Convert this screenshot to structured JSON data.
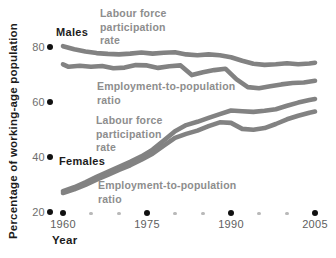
{
  "figure": {
    "y_axis": {
      "title": "Percentage of working-age population",
      "ticks": [
        {
          "value": 80,
          "label": "80"
        },
        {
          "value": 60,
          "label": "60"
        },
        {
          "value": 40,
          "label": "40"
        },
        {
          "value": 20,
          "label": "20"
        }
      ]
    },
    "x_axis": {
      "title": "Year",
      "major_ticks": [
        {
          "value": 1960,
          "label": "1960"
        },
        {
          "value": 1975,
          "label": "1975"
        },
        {
          "value": 1990,
          "label": "1990"
        },
        {
          "value": 2005,
          "label": "2005"
        }
      ],
      "minor_ticks": [
        1965,
        1970,
        1980,
        1985,
        1995,
        2000
      ]
    },
    "annotations": {
      "males": "Males",
      "male_lfpr": "Labour force\nparticipation\nrate",
      "male_emp": "Employment-to-population\nratio",
      "females": "Females",
      "female_lfpr": "Labour force\nparticipation\nrate",
      "female_emp": "Employment-to-population\nratio"
    },
    "colors": {
      "curve": "#828282",
      "gray_label": "#8d8d8d",
      "black_text": "#1c1c1c",
      "major_dot": "#111111",
      "minor_dot": "#b9b9b9"
    }
  },
  "chart_data": {
    "type": "line",
    "title": "",
    "xlabel": "Year",
    "ylabel": "Percentage of working-age population",
    "xlim": [
      1958,
      2006
    ],
    "ylim": [
      20,
      85
    ],
    "x_major_ticks": [
      1960,
      1975,
      1990,
      2005
    ],
    "x_minor_ticks": [
      1965,
      1970,
      1980,
      1985,
      1995,
      2000
    ],
    "y_ticks": [
      20,
      40,
      60,
      80
    ],
    "grid": false,
    "legend_position": "inline-annotations",
    "series": [
      {
        "name": "Males — Labour force participation rate",
        "x": [
          1960,
          1962,
          1964,
          1966,
          1968,
          1970,
          1972,
          1974,
          1976,
          1978,
          1980,
          1982,
          1984,
          1986,
          1988,
          1990,
          1992,
          1994,
          1996,
          1998,
          2000,
          2002,
          2004,
          2005
        ],
        "y": [
          80.3,
          79.2,
          78.4,
          77.8,
          77.5,
          77.3,
          77.6,
          78.0,
          77.6,
          77.9,
          78.1,
          77.3,
          77.0,
          77.3,
          77.0,
          76.3,
          75.0,
          73.9,
          73.5,
          73.7,
          74.1,
          73.7,
          74.0,
          74.3
        ]
      },
      {
        "name": "Males — Employment-to-population ratio",
        "x": [
          1960,
          1961,
          1963,
          1965,
          1967,
          1969,
          1971,
          1973,
          1975,
          1977,
          1979,
          1981,
          1983,
          1985,
          1987,
          1989,
          1991,
          1993,
          1995,
          1997,
          1999,
          2001,
          2003,
          2005
        ],
        "y": [
          73.7,
          72.8,
          73.2,
          72.8,
          73.1,
          72.3,
          72.5,
          73.4,
          73.3,
          72.4,
          73.0,
          73.3,
          69.8,
          70.8,
          71.6,
          72.1,
          68.2,
          65.4,
          65.0,
          65.7,
          66.4,
          66.9,
          67.1,
          67.7
        ]
      },
      {
        "name": "Females — Labour force participation rate",
        "x": [
          1960,
          1962,
          1964,
          1966,
          1968,
          1970,
          1972,
          1974,
          1976,
          1978,
          1980,
          1982,
          1984,
          1986,
          1988,
          1990,
          1992,
          1994,
          1996,
          1998,
          2000,
          2002,
          2004,
          2005
        ],
        "y": [
          27.6,
          29.0,
          30.8,
          32.8,
          34.6,
          36.4,
          38.2,
          40.2,
          42.7,
          46.0,
          49.4,
          51.6,
          52.8,
          54.2,
          55.6,
          56.9,
          56.6,
          56.4,
          56.8,
          57.4,
          58.6,
          59.8,
          60.7,
          61.1
        ]
      },
      {
        "name": "Females — Employment-to-population ratio",
        "x": [
          1960,
          1962,
          1964,
          1966,
          1968,
          1970,
          1972,
          1974,
          1976,
          1978,
          1980,
          1982,
          1984,
          1986,
          1988,
          1990,
          1992,
          1994,
          1996,
          1998,
          2000,
          2002,
          2004,
          2005
        ],
        "y": [
          26.9,
          28.2,
          29.9,
          31.8,
          33.5,
          35.3,
          37.0,
          39.0,
          41.2,
          44.1,
          47.0,
          48.4,
          49.6,
          51.2,
          52.6,
          52.4,
          50.2,
          49.9,
          50.5,
          52.0,
          53.7,
          55.0,
          56.1,
          56.5
        ]
      }
    ]
  }
}
